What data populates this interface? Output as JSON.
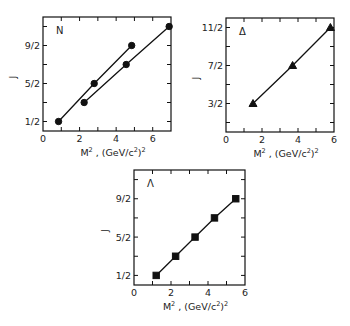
{
  "chart_data": [
    {
      "id": "N",
      "type": "line",
      "title": "N",
      "xlabel": "M^2 , (GeV/c^2)^2",
      "ylabel": "J",
      "xlim": [
        0,
        7
      ],
      "ylim": [
        0,
        6
      ],
      "x_ticks": [
        0,
        1,
        2,
        3,
        4,
        5,
        6,
        7
      ],
      "x_tick_labels": [
        "0",
        "",
        "2",
        "",
        "4",
        "",
        "6",
        ""
      ],
      "y_ticks": [
        0.5,
        1.5,
        2.5,
        3.5,
        4.5,
        5.5
      ],
      "y_tick_labels": [
        "1/2",
        "",
        "5/2",
        "",
        "9/2",
        ""
      ],
      "marker": "circle",
      "grid": false,
      "series": [
        {
          "name": "N (upper)",
          "x": [
            0.85,
            2.8,
            4.85
          ],
          "y": [
            0.5,
            2.5,
            4.5
          ]
        },
        {
          "name": "N (lower)",
          "x": [
            2.25,
            4.55,
            6.9
          ],
          "y": [
            1.5,
            3.5,
            5.5
          ]
        }
      ]
    },
    {
      "id": "Delta",
      "type": "line",
      "title": "Δ",
      "xlabel": "M^2 , (GeV/c^2)^2",
      "ylabel": "J",
      "xlim": [
        0,
        6
      ],
      "ylim": [
        0,
        6
      ],
      "x_ticks": [
        0,
        1,
        2,
        3,
        4,
        5,
        6
      ],
      "x_tick_labels": [
        "0",
        "",
        "2",
        "",
        "4",
        "",
        "6"
      ],
      "y_ticks": [
        0.5,
        1.5,
        2.5,
        3.5,
        4.5,
        5.5
      ],
      "y_tick_labels": [
        "",
        "3/2",
        "",
        "7/2",
        "",
        "11/2"
      ],
      "marker": "triangle",
      "grid": false,
      "series": [
        {
          "name": "Δ",
          "x": [
            1.5,
            3.7,
            5.8
          ],
          "y": [
            1.5,
            3.5,
            5.5
          ]
        }
      ]
    },
    {
      "id": "Lambda",
      "type": "line",
      "title": "Λ",
      "xlabel": "M^2 , (GeV/c^2)^2",
      "ylabel": "J",
      "xlim": [
        0,
        6
      ],
      "ylim": [
        0,
        6
      ],
      "x_ticks": [
        0,
        1,
        2,
        3,
        4,
        5,
        6
      ],
      "x_tick_labels": [
        "0",
        "",
        "2",
        "",
        "4",
        "",
        "6"
      ],
      "y_ticks": [
        0.5,
        1.5,
        2.5,
        3.5,
        4.5,
        5.5
      ],
      "y_tick_labels": [
        "1/2",
        "",
        "5/2",
        "",
        "9/2",
        ""
      ],
      "marker": "square",
      "grid": false,
      "series": [
        {
          "name": "Λ",
          "x": [
            1.2,
            2.25,
            3.3,
            4.35,
            5.5
          ],
          "y": [
            0.5,
            1.5,
            2.5,
            3.5,
            4.5
          ]
        }
      ]
    }
  ],
  "layout": [
    {
      "left": 43,
      "top": 17,
      "right": 171,
      "bottom": 131,
      "ylabel_x": 16
    },
    {
      "left": 226,
      "top": 18,
      "right": 334,
      "bottom": 132,
      "ylabel_x": 199
    },
    {
      "left": 134,
      "top": 170,
      "right": 245,
      "bottom": 285,
      "ylabel_x": 108
    }
  ],
  "axis_text": {
    "xlabel_main": "M",
    "xlabel_sup1": "2",
    "xlabel_mid": " ,  (GeV/c",
    "xlabel_sup2": "2",
    "xlabel_end": ")",
    "xlabel_sup3": "2",
    "ylabel": "J"
  }
}
